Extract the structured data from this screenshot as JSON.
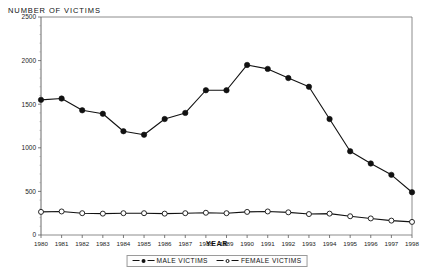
{
  "chart_data": {
    "type": "line",
    "title": "",
    "ylabel": "NUMBER OF VICTIMS",
    "xlabel": "YEAR",
    "grid": false,
    "legend_position": "bottom",
    "ylim": [
      0,
      2500
    ],
    "yticks": [
      0,
      500,
      1000,
      1500,
      2000,
      2500
    ],
    "ytick_labels": [
      "0",
      "500",
      "1000",
      "1500",
      "2000",
      "2500"
    ],
    "categories": [
      "1980",
      "1981",
      "1982",
      "1983",
      "1984",
      "1985",
      "1986",
      "1987",
      "1988",
      "1989",
      "1990",
      "1991",
      "1992",
      "1993",
      "1994",
      "1995",
      "1996",
      "1997",
      "1998"
    ],
    "series": [
      {
        "name": "MALE VICTIMS",
        "marker": "filled-circle",
        "color": "#111111",
        "values": [
          1550,
          1565,
          1430,
          1390,
          1190,
          1150,
          1330,
          1400,
          1660,
          1660,
          1950,
          1905,
          1800,
          1700,
          1330,
          960,
          820,
          690,
          490
        ]
      },
      {
        "name": "FEMALE VICTIMS",
        "marker": "open-circle",
        "color": "#111111",
        "values": [
          265,
          270,
          250,
          245,
          250,
          250,
          245,
          250,
          255,
          250,
          265,
          270,
          260,
          240,
          245,
          215,
          190,
          165,
          150
        ]
      }
    ]
  },
  "legend": {
    "items": [
      {
        "label": "MALE VICTIMS",
        "marker": "filled-circle"
      },
      {
        "label": "FEMALE VICTIMS",
        "marker": "open-circle"
      }
    ]
  }
}
